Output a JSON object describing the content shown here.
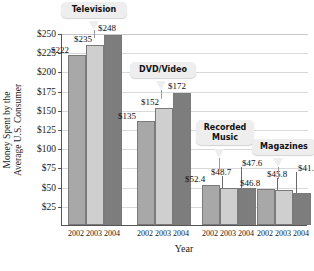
{
  "chart_data": {
    "type": "bar",
    "title": "",
    "xlabel": "Year",
    "ylabel": "Money Spent by the Average U.S. Consumer",
    "ylabel_line1": "Money Spent by the",
    "ylabel_line2": "Average U.S. Consumer",
    "ylim": [
      0,
      250
    ],
    "ytick_labels": [
      "$250",
      "$225",
      "$200",
      "$175",
      "$150",
      "$125",
      "$100",
      "$75",
      "$50",
      "$25"
    ],
    "ytick_values": [
      250,
      225,
      200,
      175,
      150,
      125,
      100,
      75,
      50,
      25
    ],
    "grid": true,
    "legend": "none",
    "categories": [
      "2002",
      "2003",
      "2004"
    ],
    "groups": [
      {
        "name": "Television",
        "xtick_labels": [
          "2002",
          "2003",
          "2004"
        ],
        "values": [
          222,
          235,
          248
        ],
        "value_labels": [
          "$222",
          "$235",
          "$248"
        ]
      },
      {
        "name": "DVD/Video",
        "xtick_labels": [
          "2002",
          "2003",
          "2004"
        ],
        "values": [
          135,
          152,
          172
        ],
        "value_labels": [
          "$135",
          "$152",
          "$172"
        ]
      },
      {
        "name": "Recorded\nMusic",
        "xtick_labels": [
          "2002",
          "2003",
          "2004"
        ],
        "values": [
          52.4,
          48.7,
          47.6
        ],
        "value_labels": [
          "$52.4",
          "$48.7",
          "$47.6"
        ]
      },
      {
        "name": "Magazines",
        "xtick_labels": [
          "2002",
          "2003",
          "2004"
        ],
        "values": [
          46.8,
          45.8,
          41.2
        ],
        "value_labels": [
          "$46.8",
          "$45.8",
          "$41.2"
        ]
      }
    ],
    "series_colors": {
      "2002": "#a8a8a8",
      "2003": "#cfcfcf",
      "2004": "#7d7d7d"
    },
    "annotation_bubbles": [
      {
        "label": "Television"
      },
      {
        "label": "DVD/Video"
      },
      {
        "label": "Recorded\nMusic"
      },
      {
        "label": "Magazines"
      }
    ]
  }
}
